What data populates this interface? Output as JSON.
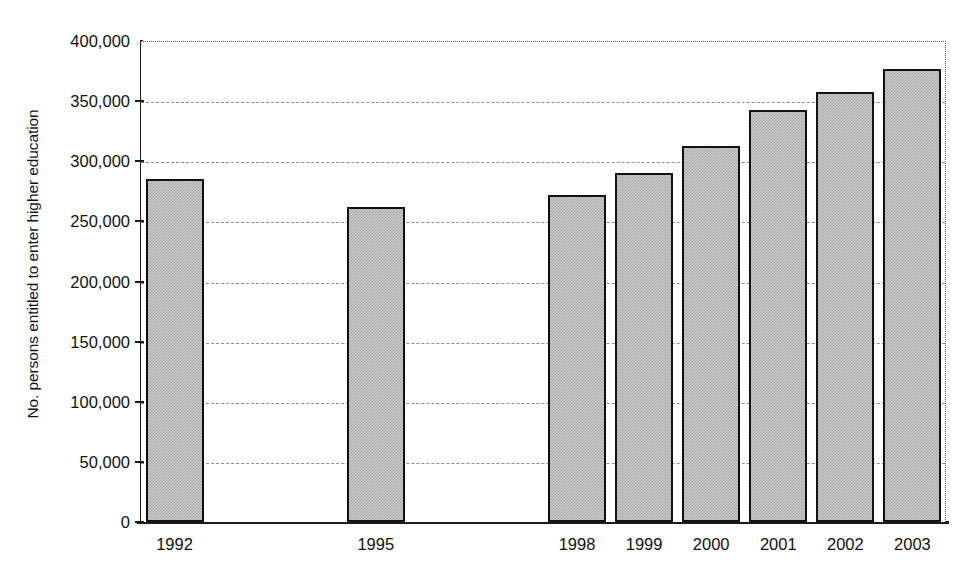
{
  "chart_data": {
    "type": "bar",
    "title": "",
    "subtitle": "",
    "xlabel": "",
    "ylabel": "No. persons entitled to enter higher education",
    "categories": [
      "1992",
      "1995",
      "1998",
      "1999",
      "2000",
      "2001",
      "2002",
      "2003"
    ],
    "values": [
      285000,
      262000,
      272000,
      290000,
      313000,
      343000,
      358000,
      377000
    ],
    "y_tick_labels": [
      "400,000",
      "350,000",
      "300,000",
      "250,000",
      "200,000",
      "150,000",
      "100,000",
      "50,000",
      "0"
    ],
    "y_tick_values": [
      400000,
      350000,
      300000,
      250000,
      200000,
      150000,
      100000,
      50000,
      0
    ],
    "ylim": [
      0,
      400000
    ],
    "y_tick_interval": 50000,
    "grid": true,
    "gridline_style": "dashed",
    "legend": "none",
    "bar_fill": "#c9c9c9",
    "bar_border": "#111111",
    "gridline_color": "#8e8e8e",
    "axis_color": "#1a1a1a",
    "annotations": [],
    "series": [
      {
        "name": "No. persons entitled to enter higher education",
        "values": [
          285000,
          262000,
          272000,
          290000,
          313000,
          343000,
          358000,
          377000
        ]
      }
    ],
    "points": [
      {
        "category": "1992",
        "value": 285000
      },
      {
        "category": "1995",
        "value": 262000
      },
      {
        "category": "1998",
        "value": 272000
      },
      {
        "category": "1999",
        "value": 290000
      },
      {
        "category": "2000",
        "value": 313000
      },
      {
        "category": "2001",
        "value": 343000
      },
      {
        "category": "2002",
        "value": 358000
      },
      {
        "category": "2003",
        "value": 377000
      }
    ],
    "missing_categories": [
      "1993",
      "1994",
      "1996",
      "1997"
    ]
  }
}
